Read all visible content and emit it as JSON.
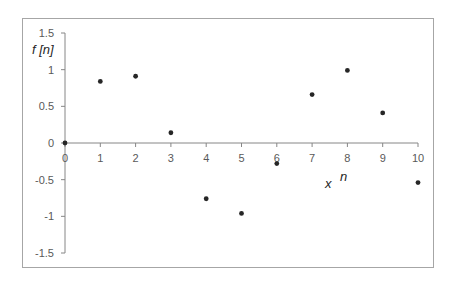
{
  "chart_data": {
    "type": "scatter",
    "title": "",
    "xlabel": "x n",
    "ylabel": "f [n]",
    "x": [
      0,
      1,
      2,
      3,
      4,
      5,
      6,
      7,
      8,
      9,
      10
    ],
    "series": [
      {
        "name": "f[n]",
        "values": [
          0,
          0.84,
          0.91,
          0.14,
          -0.76,
          -0.96,
          -0.28,
          0.66,
          0.99,
          0.41,
          -0.54
        ]
      }
    ],
    "xlim": [
      0,
      10
    ],
    "ylim": [
      -1.5,
      1.5
    ],
    "x_ticks": [
      "0",
      "1",
      "2",
      "3",
      "4",
      "5",
      "6",
      "7",
      "8",
      "9",
      "10"
    ],
    "y_ticks": [
      "1.5",
      "1",
      "0.5",
      "0",
      "-0.5",
      "-1",
      "-1.5"
    ],
    "grid": false,
    "legend": "none",
    "colors": {
      "marker": "#262626",
      "axis": "#868686",
      "border": "#a6a6a6",
      "text": "#595959"
    }
  },
  "labels": {
    "y_axis_title": "f [n]",
    "x_axis_title_x": "x",
    "x_axis_title_n": "n"
  }
}
